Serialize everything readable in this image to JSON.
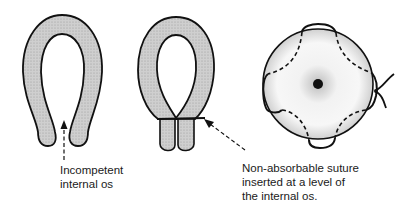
{
  "figure": {
    "panels": [
      {
        "id": "incompetent-cervix",
        "label_lines": [
          "Incompetent",
          "internal os"
        ]
      },
      {
        "id": "cerclage-side-view",
        "label_lines": [
          "Non-absorbable suture",
          "inserted at a level of",
          "the internal os."
        ]
      },
      {
        "id": "cerclage-end-view"
      }
    ],
    "colors": {
      "tissue_fill": "#c8c8c8",
      "outline": "#111111",
      "background": "#ffffff"
    }
  }
}
